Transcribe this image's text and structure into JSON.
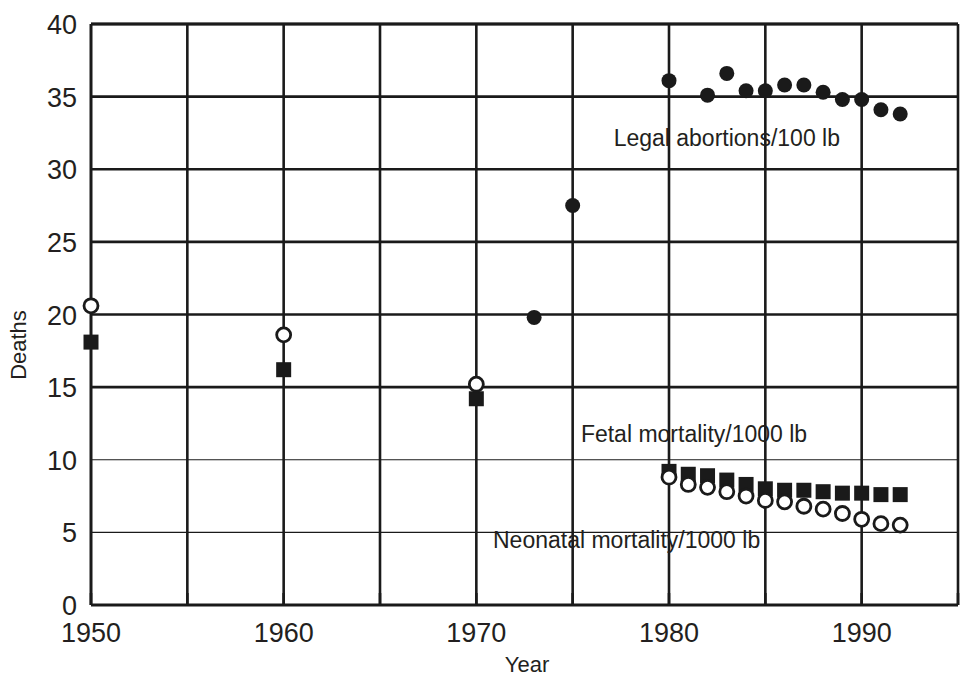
{
  "chart_data": {
    "type": "scatter",
    "title": "",
    "xlabel": "Year",
    "ylabel": "Deaths",
    "xlim": [
      1950,
      1995
    ],
    "ylim": [
      0,
      40
    ],
    "xticks": [
      1950,
      1960,
      1970,
      1980,
      1990
    ],
    "xtick_labels": [
      "1950",
      "1960",
      "1970",
      "1980",
      "1990"
    ],
    "x_minor_ticks": [
      1955,
      1965,
      1975,
      1985,
      1995
    ],
    "yticks": [
      0,
      5,
      10,
      15,
      20,
      25,
      30,
      35,
      40
    ],
    "ytick_labels": [
      "0",
      "5",
      "10",
      "15",
      "20",
      "25",
      "30",
      "35",
      "40"
    ],
    "grid": true,
    "legend_position": "inline-annotations",
    "series": [
      {
        "name": "Legal abortions/100 lb",
        "marker": "filled-circle",
        "color": "#1a1a1a",
        "annotation": "Legal abortions/100 lb",
        "annotation_x": 1983.0,
        "annotation_y": 31.6,
        "points": [
          {
            "x": 1973,
            "y": 19.8
          },
          {
            "x": 1975,
            "y": 27.5
          },
          {
            "x": 1980,
            "y": 36.1
          },
          {
            "x": 1982,
            "y": 35.1
          },
          {
            "x": 1983,
            "y": 36.6
          },
          {
            "x": 1984,
            "y": 35.4
          },
          {
            "x": 1985,
            "y": 35.4
          },
          {
            "x": 1986,
            "y": 35.8
          },
          {
            "x": 1987,
            "y": 35.8
          },
          {
            "x": 1988,
            "y": 35.3
          },
          {
            "x": 1989,
            "y": 34.8
          },
          {
            "x": 1990,
            "y": 34.8
          },
          {
            "x": 1991,
            "y": 34.1
          },
          {
            "x": 1992,
            "y": 33.8
          }
        ]
      },
      {
        "name": "Fetal mortality/1000 lb",
        "marker": "filled-square",
        "color": "#1a1a1a",
        "annotation": "Fetal mortality/1000 lb",
        "annotation_x": 1981.3,
        "annotation_y": 11.2,
        "points": [
          {
            "x": 1950,
            "y": 18.1
          },
          {
            "x": 1960,
            "y": 16.2
          },
          {
            "x": 1970,
            "y": 14.2
          },
          {
            "x": 1980,
            "y": 9.2
          },
          {
            "x": 1981,
            "y": 9.0
          },
          {
            "x": 1982,
            "y": 8.9
          },
          {
            "x": 1983,
            "y": 8.6
          },
          {
            "x": 1984,
            "y": 8.3
          },
          {
            "x": 1985,
            "y": 8.0
          },
          {
            "x": 1986,
            "y": 7.9
          },
          {
            "x": 1987,
            "y": 7.9
          },
          {
            "x": 1988,
            "y": 7.8
          },
          {
            "x": 1989,
            "y": 7.7
          },
          {
            "x": 1990,
            "y": 7.7
          },
          {
            "x": 1991,
            "y": 7.6
          },
          {
            "x": 1992,
            "y": 7.6
          }
        ]
      },
      {
        "name": "Neonatal mortality/1000 lb",
        "marker": "open-circle",
        "color": "#1a1a1a",
        "annotation": "Neonatal mortality/1000 lb",
        "annotation_x": 1977.8,
        "annotation_y": 3.9,
        "points": [
          {
            "x": 1950,
            "y": 20.6
          },
          {
            "x": 1960,
            "y": 18.6
          },
          {
            "x": 1970,
            "y": 15.2
          },
          {
            "x": 1980,
            "y": 8.8
          },
          {
            "x": 1981,
            "y": 8.3
          },
          {
            "x": 1982,
            "y": 8.1
          },
          {
            "x": 1983,
            "y": 7.8
          },
          {
            "x": 1984,
            "y": 7.5
          },
          {
            "x": 1985,
            "y": 7.2
          },
          {
            "x": 1986,
            "y": 7.1
          },
          {
            "x": 1987,
            "y": 6.8
          },
          {
            "x": 1988,
            "y": 6.6
          },
          {
            "x": 1989,
            "y": 6.3
          },
          {
            "x": 1990,
            "y": 5.9
          },
          {
            "x": 1991,
            "y": 5.6
          },
          {
            "x": 1992,
            "y": 5.5
          }
        ]
      }
    ]
  }
}
